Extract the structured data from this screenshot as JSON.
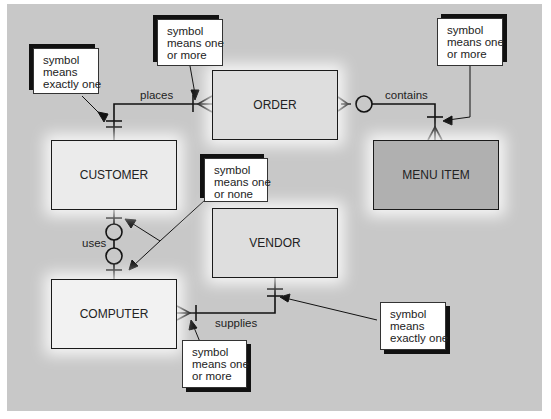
{
  "diagram": {
    "type": "entity-relationship",
    "background_color": "#c8c8c8",
    "entities": [
      {
        "id": "customer",
        "name": "CUSTOMER",
        "fill": "#ebebeb"
      },
      {
        "id": "order",
        "name": "ORDER",
        "fill": "#dedede"
      },
      {
        "id": "menu_item",
        "name": "MENU ITEM",
        "fill": "#b0b0b0"
      },
      {
        "id": "vendor",
        "name": "VENDOR",
        "fill": "#dedede"
      },
      {
        "id": "computer",
        "name": "COMPUTER",
        "fill": "#f2f2f2"
      }
    ],
    "relationships": [
      {
        "label": "places",
        "from": "CUSTOMER",
        "to": "ORDER",
        "from_cardinality": "exactly one",
        "to_cardinality": "one or more"
      },
      {
        "label": "contains",
        "from": "ORDER",
        "to": "MENU ITEM",
        "from_cardinality": "zero or more",
        "to_cardinality": "one or more"
      },
      {
        "label": "uses",
        "from": "CUSTOMER",
        "to": "COMPUTER",
        "from_cardinality": "one or none",
        "to_cardinality": "one or none"
      },
      {
        "label": "supplies",
        "from": "VENDOR",
        "to": "COMPUTER",
        "from_cardinality": "exactly one",
        "to_cardinality": "one or more"
      }
    ],
    "callouts": [
      {
        "id": "note1",
        "lines": [
          "symbol",
          "means",
          "exactly one"
        ]
      },
      {
        "id": "note2",
        "lines": [
          "symbol",
          "means one",
          "or more"
        ]
      },
      {
        "id": "note3",
        "lines": [
          "symbol",
          "means one",
          "or more"
        ]
      },
      {
        "id": "note4",
        "lines": [
          "symbol",
          "means one",
          "or none"
        ]
      },
      {
        "id": "note5",
        "lines": [
          "symbol",
          "means",
          "exactly one"
        ]
      },
      {
        "id": "note6",
        "lines": [
          "symbol",
          "means one",
          "or more"
        ]
      }
    ]
  }
}
